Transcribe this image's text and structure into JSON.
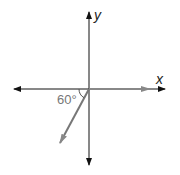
{
  "diagram": {
    "type": "coordinate-axes-with-vectors",
    "axes": {
      "x_label": "x",
      "y_label": "y"
    },
    "vectors": [
      {
        "name": "vector-along-positive-x",
        "direction_deg": 0,
        "color": "#888888"
      },
      {
        "name": "vector-down-left",
        "angle_from_negative_x_deg": 60,
        "color": "#777777"
      }
    ],
    "angle_label": "60°",
    "colors": {
      "axis": "#111111",
      "vector": "#808080"
    }
  }
}
